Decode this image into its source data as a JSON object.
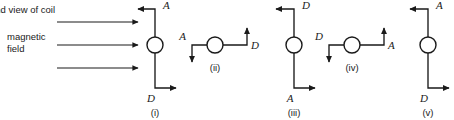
{
  "figure": {
    "title_caption": "end view of coil",
    "field_caption_line1": "magnetic",
    "field_caption_line2": "field",
    "stroke_color": "#1a1a1a",
    "background_color": "#ffffff",
    "field_arrow_count": 3
  },
  "diagrams": [
    {
      "id": "i",
      "caption": "(i)",
      "orientation": "vertical",
      "top_label": "A",
      "top_arrow_direction": "left",
      "bottom_label": "D",
      "bottom_arrow_direction": "right"
    },
    {
      "id": "ii",
      "caption": "(ii)",
      "orientation": "horizontal",
      "left_label": "A",
      "left_arrow_direction": "down",
      "right_label": "D",
      "right_arrow_direction": "up"
    },
    {
      "id": "iii",
      "caption": "(iii)",
      "orientation": "vertical",
      "top_label": "D",
      "top_arrow_direction": "left",
      "bottom_label": "A",
      "bottom_arrow_direction": "right"
    },
    {
      "id": "iv",
      "caption": "(iv)",
      "orientation": "horizontal",
      "left_label": "D",
      "left_arrow_direction": "down",
      "right_label": "A",
      "right_arrow_direction": "up"
    },
    {
      "id": "v",
      "caption": "(v)",
      "orientation": "vertical",
      "top_label": "A",
      "top_arrow_direction": "left",
      "bottom_label": "D",
      "bottom_arrow_direction": "right"
    }
  ]
}
